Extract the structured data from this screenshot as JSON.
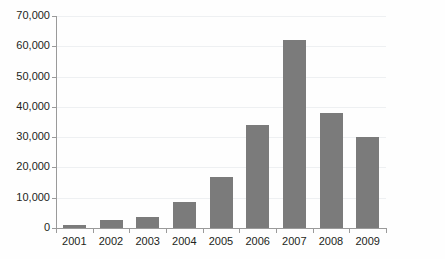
{
  "chart_data": {
    "type": "bar",
    "title": "",
    "subtitle": "",
    "xlabel": "",
    "ylabel": "",
    "categories": [
      "2001",
      "2002",
      "2003",
      "2004",
      "2005",
      "2006",
      "2007",
      "2008",
      "2009"
    ],
    "values": [
      1000,
      2500,
      3500,
      8500,
      17000,
      34000,
      62000,
      38000,
      30000
    ],
    "series": [
      {
        "name": "",
        "values": [
          1000,
          2500,
          3500,
          8500,
          17000,
          34000,
          62000,
          38000,
          30000
        ]
      }
    ],
    "ylim": [
      0,
      70000
    ],
    "ytick_values": [
      0,
      10000,
      20000,
      30000,
      40000,
      50000,
      60000,
      70000
    ],
    "ytick_labels": [
      "0",
      "10,000",
      "20,000",
      "30,000",
      "40,000",
      "50,000",
      "60,000",
      "70,000"
    ],
    "grid": true,
    "grid_axis": "y",
    "legend": false,
    "legend_position": "none",
    "annotations": [],
    "colors": {
      "bar": "#7b7b7b",
      "gridline": "#eef0f2",
      "axis": "#9a9a9a",
      "text": "#231f20",
      "background": "#fefefe"
    }
  }
}
